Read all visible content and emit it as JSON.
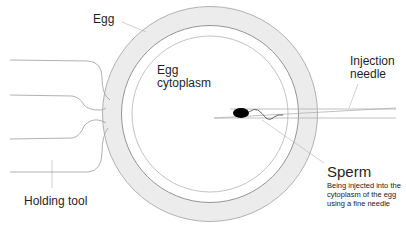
{
  "diagram": {
    "labels": {
      "egg": "Egg",
      "cytoplasm_line1": "Egg",
      "cytoplasm_line2": "cytoplasm",
      "needle_line1": "Injection",
      "needle_line2": "needle",
      "holding_tool": "Holding tool",
      "sperm": "Sperm",
      "sperm_desc_line1": "Being injected into the",
      "sperm_desc_line2": "cytoplasm of the egg",
      "sperm_desc_line3": "using a fine needle"
    },
    "colors": {
      "line": "#9a9a9a",
      "ring_fill": "#ececec",
      "sperm_head": "#000000",
      "background": "#ffffff"
    }
  }
}
